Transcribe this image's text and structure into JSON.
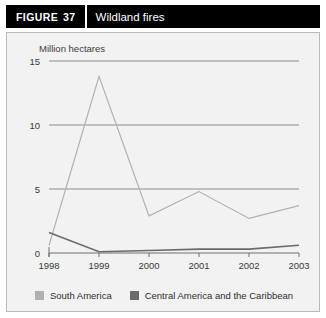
{
  "header": {
    "figure_label": "FIGURE",
    "figure_number": "37",
    "title": "Wildland fires"
  },
  "colors": {
    "header_bg": "#000000",
    "header_text": "#ffffff",
    "panel_bg": "#f2f2f2",
    "panel_border": "#b9b9b9",
    "grid": "#8e8e8e",
    "axis": "#6f6f6f",
    "series_south_america": "#b0b0b0",
    "series_central_america": "#6b6b6b",
    "tick_text": "#3a3a3a"
  },
  "chart_data": {
    "type": "line",
    "title": "Wildland fires",
    "xlabel": "",
    "ylabel": "Million hectares",
    "x": [
      "1998",
      "1999",
      "2000",
      "2001",
      "2002",
      "2003"
    ],
    "ylim": [
      0,
      15
    ],
    "yticks": [
      0,
      5,
      10,
      15
    ],
    "ytick_labels": [
      "0",
      "5",
      "10",
      "15"
    ],
    "grid": true,
    "legend_position": "bottom",
    "series": [
      {
        "name": "South America",
        "color": "#b0b0b0",
        "values": [
          0.6,
          13.8,
          2.9,
          4.8,
          2.7,
          3.7
        ]
      },
      {
        "name": "Central America and the Caribbean",
        "color": "#6b6b6b",
        "values": [
          1.6,
          0.1,
          0.2,
          0.3,
          0.3,
          0.6
        ]
      }
    ]
  }
}
